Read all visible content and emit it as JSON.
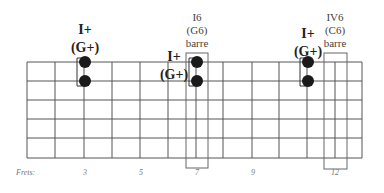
{
  "diagram": {
    "type": "guitar-fretboard",
    "strings": 6,
    "frets_shown": 12,
    "frets_label": "Frets:",
    "fret_markers": [
      {
        "fret": 3,
        "label": "3",
        "x": 84
      },
      {
        "fret": 5,
        "label": "5",
        "x": 140
      },
      {
        "fret": 7,
        "label": "7",
        "x": 197
      },
      {
        "fret": 9,
        "label": "9",
        "x": 253
      },
      {
        "fret": 12,
        "label": "12",
        "x": 335
      }
    ],
    "chords": [
      {
        "name": "I+",
        "alt": "(G+)",
        "fret_line": 3,
        "strings": [
          1,
          2
        ]
      },
      {
        "name": "I+",
        "alt": "(G+)",
        "fret_line": 7,
        "strings": [
          1,
          2
        ]
      },
      {
        "name": "I+",
        "alt": "(G+)",
        "fret_line": 10,
        "strings": [
          1,
          2
        ]
      }
    ],
    "barres": [
      {
        "name": "I6",
        "alt": "(G6)",
        "type": "barre",
        "fret": 7
      },
      {
        "name": "IV6",
        "alt": "(C6)",
        "type": "barre",
        "fret": 12
      }
    ]
  },
  "labels": {
    "chord1_line1": "I+",
    "chord1_line2": "(G+)",
    "chord2_line1": "I+",
    "chord2_line2": "(G+)",
    "chord3_line1": "I+",
    "chord3_line2": "(G+)",
    "barre1_line1": "I6",
    "barre1_line2": "(G6)",
    "barre1_line3": "barre",
    "barre2_line1": "IV6",
    "barre2_line2": "(C6)",
    "barre2_line3": "barre",
    "frets": "Frets:",
    "f3": "3",
    "f5": "5",
    "f7": "7",
    "f9": "9",
    "f12": "12"
  },
  "colors": {
    "grid": "#555555",
    "dot": "#1a1a1a",
    "box": "#666666"
  }
}
